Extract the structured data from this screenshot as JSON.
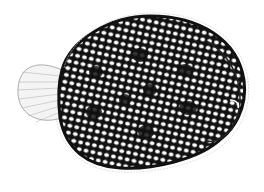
{
  "image": {
    "subject": "flatfish illustration",
    "style": "black and white reticulated ink drawing",
    "background_color": "#ffffff",
    "ink_color": "#111111",
    "fin_color": "#bbbbbb"
  }
}
